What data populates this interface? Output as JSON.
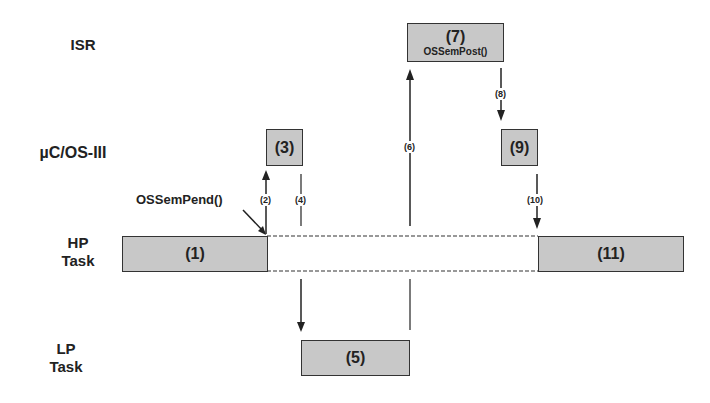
{
  "lanes": {
    "isr": "ISR",
    "kernel": "µC/OS-III",
    "hp_task_line1": "HP",
    "hp_task_line2": "Task",
    "lp_task_line1": "LP",
    "lp_task_line2": "Task"
  },
  "boxes": {
    "b1": "(1)",
    "b3": "(3)",
    "b5": "(5)",
    "b7": "(7)",
    "b7_sub": "OSSemPost()",
    "b9": "(9)",
    "b11": "(11)"
  },
  "annotations": {
    "pend_call": "OSSemPend()"
  },
  "steps": {
    "s2": "(2)",
    "s4": "(4)",
    "s6": "(6)",
    "s8": "(8)",
    "s10": "(10)"
  },
  "colors": {
    "box_fill": "#c8c8c8",
    "line": "#222222"
  }
}
